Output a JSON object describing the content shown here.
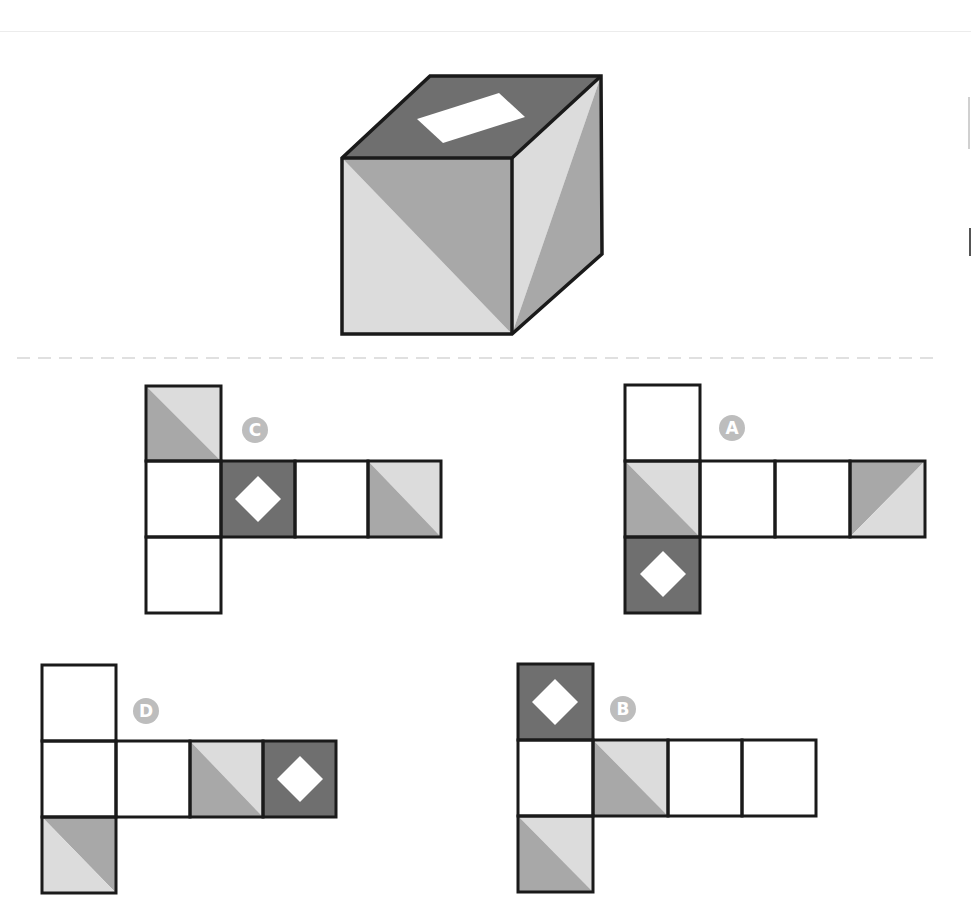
{
  "puzzle": {
    "type": "cube-net-matching",
    "colors": {
      "outline": "#1a1a1a",
      "dark": "#6f6f6f",
      "mid": "#a8a8a8",
      "light": "#dcdcdc",
      "white": "#ffffff",
      "label_circle": "#bdbdbd",
      "separator": "#d6d6d6"
    },
    "cube": {
      "top_face": "dark with white rectangle",
      "front_face": "diagonal split: mid upper-right, light lower-left",
      "right_face": "diagonal split: light left, mid right"
    },
    "options": [
      {
        "label": "C",
        "cells": [
          {
            "col": 0,
            "row": 0,
            "fill": "diag-tl-br"
          },
          {
            "col": 0,
            "row": 1,
            "fill": "white"
          },
          {
            "col": 1,
            "row": 1,
            "fill": "dark-diamond"
          },
          {
            "col": 2,
            "row": 1,
            "fill": "white"
          },
          {
            "col": 3,
            "row": 1,
            "fill": "diag-tl-br"
          },
          {
            "col": 0,
            "row": 2,
            "fill": "white"
          }
        ]
      },
      {
        "label": "A",
        "cells": [
          {
            "col": 0,
            "row": 0,
            "fill": "white"
          },
          {
            "col": 0,
            "row": 1,
            "fill": "diag-tl-br"
          },
          {
            "col": 1,
            "row": 1,
            "fill": "white"
          },
          {
            "col": 2,
            "row": 1,
            "fill": "white"
          },
          {
            "col": 3,
            "row": 1,
            "fill": "diag-bl-tr"
          },
          {
            "col": 0,
            "row": 2,
            "fill": "dark-diamond"
          }
        ]
      },
      {
        "label": "D",
        "cells": [
          {
            "col": 0,
            "row": 0,
            "fill": "white"
          },
          {
            "col": 0,
            "row": 1,
            "fill": "white"
          },
          {
            "col": 1,
            "row": 1,
            "fill": "white"
          },
          {
            "col": 2,
            "row": 1,
            "fill": "diag-tl-br"
          },
          {
            "col": 3,
            "row": 1,
            "fill": "dark-diamond"
          },
          {
            "col": 0,
            "row": 2,
            "fill": "diag-tl-br-inv"
          }
        ]
      },
      {
        "label": "B",
        "cells": [
          {
            "col": 0,
            "row": 0,
            "fill": "dark-diamond"
          },
          {
            "col": 0,
            "row": 1,
            "fill": "white"
          },
          {
            "col": 1,
            "row": 1,
            "fill": "diag-tl-br"
          },
          {
            "col": 2,
            "row": 1,
            "fill": "white"
          },
          {
            "col": 3,
            "row": 1,
            "fill": "white"
          },
          {
            "col": 0,
            "row": 2,
            "fill": "diag-tl-br"
          }
        ]
      }
    ]
  }
}
